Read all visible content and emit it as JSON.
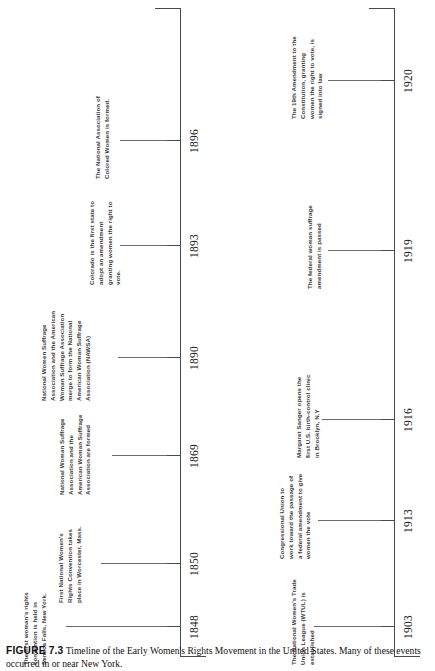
{
  "figure": {
    "number": "FIGURE 7.3",
    "caption": "Timeline of the Early Women's Rights Movement in the United States. Many of these events occurred in or near New York."
  },
  "timeline": {
    "rows": [
      {
        "id": "upper",
        "events": [
          {
            "year": "1848",
            "text": "The first woman's rights convention is held in Seneca Falls, New York."
          },
          {
            "year": "1850",
            "text": "First National Women's Rights Convention takes place in Worcester, Mass."
          },
          {
            "year": "1869",
            "text": "National Woman Suffrage Association and the American Woman Suffrage Association are formed"
          },
          {
            "year": "1890",
            "text": "National Women Suffrage Association and the American Woman Suffrage Association merge to form the National American Woman Suffrage Association (NAWSA)"
          },
          {
            "year": "1893",
            "text": "Colorado is the first state to adopt an amendment granting women the right to vote."
          },
          {
            "year": "1896",
            "text": "The National Association of Colored Women is formed."
          }
        ]
      },
      {
        "id": "lower",
        "events": [
          {
            "year": "1903",
            "text": "The National Women's Trade Union League (WTUL) is established"
          },
          {
            "year": "1913",
            "text": "Congressional Union to work toward the passage of a federal amendment to give women the vote"
          },
          {
            "year": "1916",
            "text": "Margaret Sanger opens the first U.S. birth-control clinic in Brooklyn, N.Y"
          },
          {
            "year": "1919",
            "text": "The federal woman suffrage amendment is passed"
          },
          {
            "year": "1920",
            "text": "The 19th Amendment to the Constitution, granting women the right to vote, is signed into law"
          }
        ]
      }
    ]
  }
}
